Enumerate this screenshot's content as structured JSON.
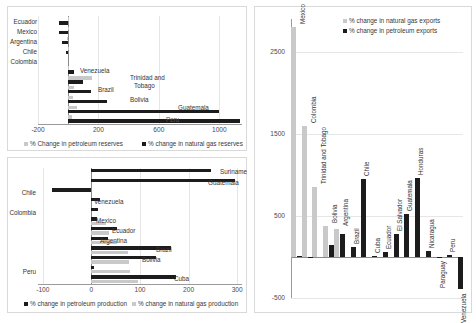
{
  "chart_data": [
    {
      "id": "reserves",
      "type": "bar",
      "orientation": "horizontal",
      "title": "",
      "xlabel": "",
      "ylabel": "",
      "xlim": [
        -200,
        1150
      ],
      "xticks": [
        "-200",
        "200",
        "600",
        "1000"
      ],
      "xtick_values": [
        -200,
        200,
        600,
        1000
      ],
      "grid": true,
      "legend": [
        {
          "name": "% Change in petroleum reserves",
          "color": "#c9c9c9"
        },
        {
          "name": "% change in natural gas reserves",
          "color": "#1c1c1c"
        }
      ],
      "categories": [
        "Ecuador",
        "Mexico",
        "Argentina",
        "Chile",
        "Colombia",
        "Venezuela",
        "Trinidad and Tobago",
        "Brazil",
        "Bolivia",
        "Guatemala",
        "Peru"
      ],
      "series": [
        {
          "name": "% Change in petroleum reserves",
          "color": "#c9c9c9",
          "values": [
            -2,
            -4,
            -6,
            -2,
            0,
            6,
            160,
            40,
            30,
            55,
            25
          ]
        },
        {
          "name": "% change in natural gas reserves",
          "color": "#1c1c1c",
          "values": [
            -62,
            -58,
            -40,
            -18,
            0,
            40,
            95,
            150,
            255,
            995,
            1140
          ]
        }
      ]
    },
    {
      "id": "production",
      "type": "bar",
      "orientation": "horizontal",
      "title": "",
      "xlabel": "",
      "ylabel": "",
      "xlim": [
        -110,
        310
      ],
      "xticks": [
        "-100",
        "0",
        "100",
        "200",
        "300"
      ],
      "xtick_values": [
        -100,
        0,
        100,
        200,
        300
      ],
      "grid": true,
      "legend": [
        {
          "name": "% change in petroleum production",
          "color": "#1c1c1c"
        },
        {
          "name": "% change in natural gas production",
          "color": "#c9c9c9"
        }
      ],
      "categories": [
        "Suriname",
        "Guatemala",
        "Chile",
        "Venezuela",
        "Colombia",
        "Mexico",
        "Ecuador",
        "Argentina",
        "Brazil",
        "Bolivia",
        "Peru",
        "Cuba"
      ],
      "series": [
        {
          "name": "% change in petroleum production",
          "color": "#1c1c1c",
          "values": [
            247,
            295,
            -82,
            17,
            14,
            11,
            52,
            35,
            163,
            133,
            6,
            175
          ]
        },
        {
          "name": "% change in natural gas production",
          "color": "#c9c9c9",
          "values": [
            0,
            0,
            0,
            0,
            0,
            29,
            36,
            52,
            75,
            78,
            80,
            95
          ]
        }
      ]
    },
    {
      "id": "exports",
      "type": "bar",
      "orientation": "vertical",
      "title": "",
      "xlabel": "",
      "ylabel": "",
      "ylim": [
        -500,
        2900
      ],
      "yticks": [
        "2500",
        "1500",
        "500",
        "-500"
      ],
      "ytick_values": [
        2500,
        1500,
        500,
        -500
      ],
      "grid": true,
      "legend": [
        {
          "name": "% change in natural gas exports",
          "color": "#c9c9c9"
        },
        {
          "name": "% change in petroleum exports",
          "color": "#1c1c1c"
        }
      ],
      "categories": [
        "Mexico",
        "Colombia",
        "Trinidad and Tobago",
        "Bolivia",
        "Argentina",
        "Brazil",
        "Chile",
        "Cuba",
        "Ecuador",
        "El Salvador",
        "Guatemala",
        "Honduras",
        "Nicaragua",
        "Paraguay",
        "Peru",
        "Venezuela"
      ],
      "series": [
        {
          "name": "% change in natural gas exports",
          "color": "#c9c9c9",
          "values": [
            2800,
            1600,
            850,
            380,
            335,
            0,
            0,
            0,
            0,
            0,
            0,
            0,
            0,
            0,
            0,
            0
          ]
        },
        {
          "name": "% change in petroleum exports",
          "color": "#1c1c1c",
          "values": [
            8,
            -18,
            0,
            140,
            275,
            120,
            950,
            10,
            55,
            285,
            520,
            960,
            70,
            -8,
            30,
            -390
          ]
        }
      ]
    }
  ]
}
